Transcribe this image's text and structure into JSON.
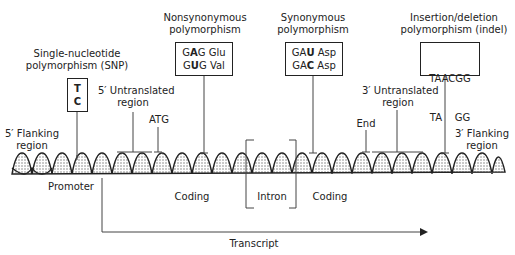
{
  "diagram": {
    "callouts": {
      "snp": {
        "title_line1": "Single-nucleotide",
        "title_line2": "polymorphism (SNP)",
        "box_line1": "T",
        "box_line2": "C"
      },
      "nonsyn": {
        "title_line1": "Nonsynonymous",
        "title_line2": "polymorphism",
        "box_line1_a": "G",
        "box_line1_b": "A",
        "box_line1_c": "G Glu",
        "box_line2_a": "G",
        "box_line2_b": "U",
        "box_line2_c": "G Val"
      },
      "syn": {
        "title_line1": "Synonymous",
        "title_line2": "polymorphism",
        "box_line1_a": "GA",
        "box_line1_b": "U",
        "box_line1_c": " Asp",
        "box_line2_a": "GA",
        "box_line2_b": "C",
        "box_line2_c": " Asp"
      },
      "indel": {
        "title_line1": "Insertion/deletion",
        "title_line2": "polymorphism (indel)",
        "box_line1": "TAACGG",
        "box_line2": "TA    GG"
      }
    },
    "regions": {
      "five_utr_1": "5′ Untranslated",
      "five_utr_2": "region",
      "atg": "ATG",
      "five_flank_1": "5′ Flanking",
      "five_flank_2": "region",
      "promoter": "Promoter",
      "coding1": "Coding",
      "intron": "Intron",
      "coding2": "Coding",
      "end": "End",
      "three_utr_1": "3′ Untranslated",
      "three_utr_2": "region",
      "three_flank_1": "3′ Flanking",
      "three_flank_2": "region"
    },
    "transcript": "Transcript"
  }
}
